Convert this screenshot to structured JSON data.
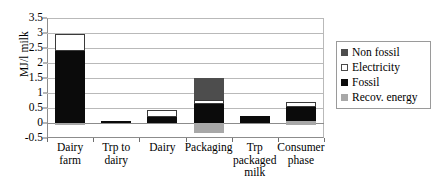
{
  "chart_data": {
    "type": "bar",
    "subtype": "stacked-bar-with-negative",
    "title": "",
    "xlabel": "",
    "ylabel": "MJ/l milk",
    "ylim": [
      -0.5,
      3.5
    ],
    "ytick_step": 0.5,
    "yticks": [
      "3.5",
      "3",
      "2.5",
      "2",
      "1.5",
      "1",
      "0.5",
      "0",
      "-0.5"
    ],
    "ytick_values": [
      3.5,
      3,
      2.5,
      2,
      1.5,
      1,
      0.5,
      0,
      -0.5
    ],
    "grid": true,
    "legend_position": "right",
    "categories": [
      "Dairy farm",
      "Trp to dairy",
      "Dairy",
      "Packaging",
      "Trp packaged milk",
      "Consumer phase"
    ],
    "category_lines": [
      [
        "Dairy",
        "farm"
      ],
      [
        "Trp to",
        "dairy"
      ],
      [
        "Dairy"
      ],
      [
        "Packaging"
      ],
      [
        "Trp",
        "packaged",
        "milk"
      ],
      [
        "Consumer",
        "phase"
      ]
    ],
    "series": [
      {
        "name": "Non fossil",
        "color": "#4d4d4d",
        "values": [
          0,
          0,
          0,
          0.72,
          0,
          0
        ]
      },
      {
        "name": "Electricity",
        "color": "#ffffff",
        "values": [
          0.57,
          0,
          0.22,
          0.16,
          0,
          0.15
        ]
      },
      {
        "name": "Fossil",
        "color": "#0b0b0b",
        "values": [
          2.4,
          0.07,
          0.2,
          0.62,
          0.24,
          0.48
        ]
      },
      {
        "name": "Recov. energy",
        "color": "#a8a8a8",
        "values": [
          -0.08,
          0,
          0,
          -0.32,
          0,
          -0.07
        ]
      }
    ],
    "bar_segments": [
      [
        {
          "series": "Recov. energy",
          "from": -0.08,
          "to": 0
        },
        {
          "series": "Fossil",
          "from": 0,
          "to": 2.4
        },
        {
          "series": "Electricity",
          "from": 2.4,
          "to": 2.97
        }
      ],
      [
        {
          "series": "Fossil",
          "from": 0,
          "to": 0.07
        }
      ],
      [
        {
          "series": "Fossil",
          "from": 0,
          "to": 0.2
        },
        {
          "series": "Electricity",
          "from": 0.2,
          "to": 0.42
        }
      ],
      [
        {
          "series": "Recov. energy",
          "from": -0.32,
          "to": 0
        },
        {
          "series": "Fossil",
          "from": 0,
          "to": 0.62
        },
        {
          "series": "Electricity",
          "from": 0.62,
          "to": 0.78
        },
        {
          "series": "Non fossil",
          "from": 0.78,
          "to": 1.5
        }
      ],
      [
        {
          "series": "Fossil",
          "from": 0,
          "to": 0.24
        }
      ],
      [
        {
          "series": "Recov. energy",
          "from": -0.07,
          "to": 0.07
        },
        {
          "series": "Fossil",
          "from": 0.07,
          "to": 0.55
        },
        {
          "series": "Electricity",
          "from": 0.55,
          "to": 0.7
        }
      ]
    ]
  },
  "legend": {
    "items": [
      {
        "label": "Non fossil",
        "swatch": "nonfossil"
      },
      {
        "label": "Electricity",
        "swatch": "electricity"
      },
      {
        "label": "Fossil",
        "swatch": "fossil"
      },
      {
        "label": "Recov. energy",
        "swatch": "recov"
      }
    ]
  }
}
